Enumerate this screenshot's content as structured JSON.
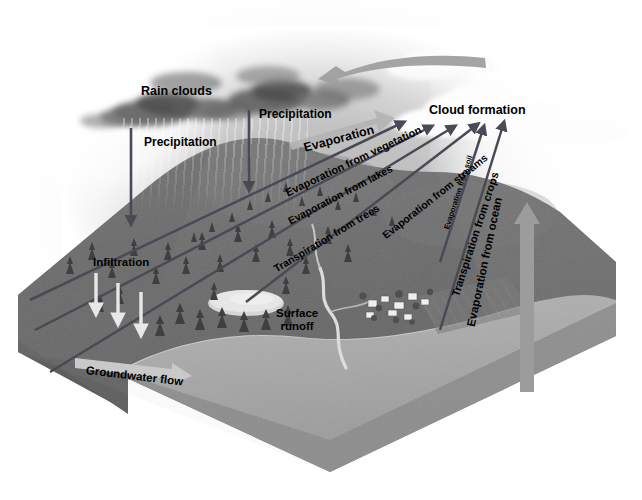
{
  "diagram": {
    "background_color": "#ffffff",
    "land_color": "#6f6f6f",
    "ocean_color": "#a8a8a8",
    "arrow_dark_color": "#4a4a56",
    "arrow_light_color": "#c9c9c9",
    "label_color": "#000000"
  },
  "labels": {
    "rain_clouds": "Rain clouds",
    "precipitation_left": "Precipitation",
    "precipitation_right": "Precipitation",
    "evaporation": "Evaporation",
    "cloud_formation": "Cloud formation",
    "evaporation_from_vegetation": "Evaporation from vegetation",
    "evaporation_from_lakes": "Evaporation from lakes",
    "transpiration_from_trees": "Transpiration from trees",
    "evaporation_from_streams": "Evaporation from streams",
    "evaporation_from_soil": "Evaporation from soil",
    "transpiration_from_crops": "Transpiration from crops",
    "evaporation_from_ocean": "Evaporation from ocean",
    "infiltration": "Infiltration",
    "groundwater_flow": "Groundwater flow",
    "surface_runoff_line1": "Surface",
    "surface_runoff_line2": "runoff"
  },
  "processes": [
    {
      "name": "Rain clouds",
      "kind": "cloud"
    },
    {
      "name": "Precipitation",
      "kind": "downward-arrow",
      "count": 2
    },
    {
      "name": "Evaporation",
      "kind": "broad-arrow"
    },
    {
      "name": "Cloud formation",
      "kind": "cloud"
    },
    {
      "name": "Evaporation from vegetation",
      "kind": "upward-arrow"
    },
    {
      "name": "Evaporation from lakes",
      "kind": "upward-arrow"
    },
    {
      "name": "Transpiration from trees",
      "kind": "upward-arrow"
    },
    {
      "name": "Evaporation from streams",
      "kind": "upward-arrow"
    },
    {
      "name": "Evaporation from soil",
      "kind": "upward-arrow"
    },
    {
      "name": "Transpiration from crops",
      "kind": "upward-arrow"
    },
    {
      "name": "Evaporation from ocean",
      "kind": "broad-upward-arrow"
    },
    {
      "name": "Infiltration",
      "kind": "downward-arrow",
      "count": 3
    },
    {
      "name": "Groundwater flow",
      "kind": "horizontal-arrow"
    },
    {
      "name": "Surface runoff",
      "kind": "river"
    }
  ]
}
